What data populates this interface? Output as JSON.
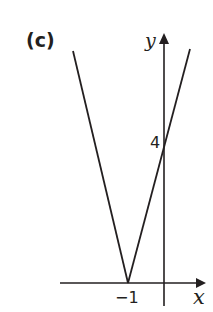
{
  "figure": {
    "part_label": "(c)",
    "x_axis_label": "x",
    "y_axis_label": "y",
    "x_tick_label": "−1",
    "y_tick_label": "4",
    "stroke_color": "#231f20",
    "background": "#ffffff"
  },
  "graph": {
    "function": "y = |4x + 4|",
    "vertex": [
      -1,
      0
    ],
    "y_intercept": [
      0,
      4
    ],
    "shape": "V"
  }
}
